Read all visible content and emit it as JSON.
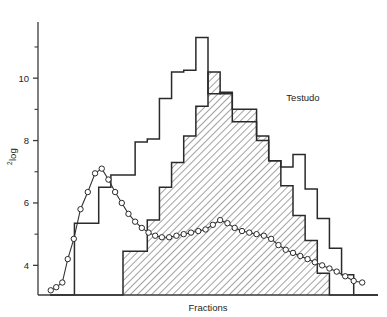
{
  "chart_data": {
    "type": "bar",
    "title": "",
    "subtitle": "",
    "xlabel": "Fractions",
    "ylabel": "²log",
    "ylabel_superscript": "2",
    "ylabel_base": "log",
    "annotation": "Testudo",
    "grid": false,
    "legend": "none",
    "xlim": [
      0,
      28
    ],
    "ylim": [
      3.05,
      11.8
    ],
    "y_ticks_major": [
      4,
      6,
      8,
      10
    ],
    "y_tick_labels": [
      "4",
      "6",
      "8",
      "10"
    ],
    "y_ticks_minor": [
      5,
      7,
      9,
      11
    ],
    "x_ticks": [],
    "x_tick_labels": [],
    "axis_color": "#3a3a3a",
    "hatch_color": "#4a4a4a",
    "outline_color": "#2a2a2a",
    "marker_fill": "#ffffff",
    "marker_edge": "#2a2a2a",
    "bar_step_fractions": 1,
    "series": [
      {
        "name": "open-histogram",
        "type": "step-histogram",
        "style": "outline",
        "filled": false,
        "categories": [
          1,
          2,
          3,
          4,
          5,
          6,
          7,
          8,
          9,
          10,
          11,
          12,
          13,
          14,
          15,
          16,
          17,
          18,
          19,
          20,
          21,
          22,
          23,
          24,
          25,
          26,
          27
        ],
        "values": [
          3.05,
          3.05,
          5.35,
          5.35,
          6.5,
          6.9,
          6.9,
          7.95,
          8.05,
          9.35,
          10.2,
          10.25,
          11.3,
          9.5,
          9.55,
          8.6,
          8.6,
          8.0,
          7.35,
          7.15,
          7.55,
          6.45,
          5.5,
          4.55,
          3.7,
          3.05,
          3.05
        ]
      },
      {
        "name": "hatched-histogram",
        "type": "step-histogram",
        "style": "hatched",
        "filled": true,
        "hatch_pattern": "diagonal-45",
        "categories": [
          1,
          2,
          3,
          4,
          5,
          6,
          7,
          8,
          9,
          10,
          11,
          12,
          13,
          14,
          15,
          16,
          17,
          18,
          19,
          20,
          21,
          22,
          23,
          24,
          25,
          26,
          27
        ],
        "values": [
          3.05,
          3.05,
          3.05,
          3.05,
          3.05,
          3.05,
          4.45,
          4.45,
          5.45,
          6.5,
          7.3,
          8.15,
          9.1,
          10.2,
          9.5,
          9.0,
          9.0,
          8.15,
          7.35,
          6.55,
          5.6,
          4.8,
          3.75,
          3.05,
          3.05,
          3.05,
          3.05
        ]
      },
      {
        "name": "open-circle-line",
        "type": "line-markers",
        "marker": "open-circle",
        "x": [
          1.05,
          1.5,
          2.0,
          2.45,
          2.95,
          3.5,
          4.1,
          4.7,
          5.25,
          5.8,
          6.35,
          6.9,
          7.45,
          8.0,
          8.55,
          9.1,
          9.65,
          10.2,
          10.8,
          11.4,
          12.0,
          12.6,
          13.2,
          13.8,
          14.4,
          15.0,
          15.6,
          16.2,
          16.8,
          17.4,
          18.0,
          18.6,
          19.2,
          19.8,
          20.4,
          21.0,
          21.6,
          22.2,
          22.8,
          23.4,
          24.0,
          24.6,
          25.3,
          26.0,
          26.7
        ],
        "y": [
          3.2,
          3.3,
          3.45,
          4.2,
          4.85,
          5.8,
          6.35,
          6.95,
          7.1,
          6.75,
          6.35,
          6.0,
          5.65,
          5.4,
          5.2,
          5.05,
          4.95,
          4.9,
          4.9,
          4.95,
          5.0,
          5.05,
          5.1,
          5.15,
          5.3,
          5.45,
          5.35,
          5.2,
          5.1,
          5.05,
          5.0,
          4.95,
          4.85,
          4.65,
          4.5,
          4.4,
          4.3,
          4.2,
          4.1,
          4.0,
          3.9,
          3.8,
          3.65,
          3.5,
          3.45
        ]
      }
    ]
  },
  "axis": {
    "y_title": "log",
    "y_title_superscript": "2",
    "x_title": "Fractions"
  },
  "annotations": {
    "species": "Testudo"
  }
}
